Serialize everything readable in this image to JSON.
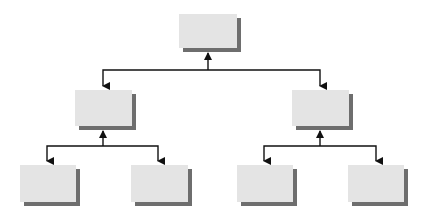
{
  "diagram": {
    "type": "org-chart-tree",
    "colors": {
      "node_fill": "#e4e4e4",
      "node_shadow": "#6e6e6e",
      "line": "#111111",
      "background": "#ffffff"
    },
    "nodes": [
      {
        "id": "root",
        "label": "",
        "level": 0,
        "x": 179,
        "y": 14,
        "w": 58,
        "h": 34
      },
      {
        "id": "mid-left",
        "label": "",
        "level": 1,
        "x": 75,
        "y": 90,
        "w": 57,
        "h": 36
      },
      {
        "id": "mid-right",
        "label": "",
        "level": 1,
        "x": 292,
        "y": 90,
        "w": 57,
        "h": 36
      },
      {
        "id": "leaf-1",
        "label": "",
        "level": 2,
        "x": 20,
        "y": 165,
        "w": 56,
        "h": 37
      },
      {
        "id": "leaf-2",
        "label": "",
        "level": 2,
        "x": 131,
        "y": 165,
        "w": 57,
        "h": 37
      },
      {
        "id": "leaf-3",
        "label": "",
        "level": 2,
        "x": 237,
        "y": 165,
        "w": 56,
        "h": 37
      },
      {
        "id": "leaf-4",
        "label": "",
        "level": 2,
        "x": 348,
        "y": 165,
        "w": 56,
        "h": 37
      }
    ],
    "edges": [
      {
        "from": "root",
        "to": "mid-left"
      },
      {
        "from": "root",
        "to": "mid-right"
      },
      {
        "from": "mid-left",
        "to": "leaf-1"
      },
      {
        "from": "mid-left",
        "to": "leaf-2"
      },
      {
        "from": "mid-right",
        "to": "leaf-3"
      },
      {
        "from": "mid-right",
        "to": "leaf-4"
      }
    ]
  }
}
